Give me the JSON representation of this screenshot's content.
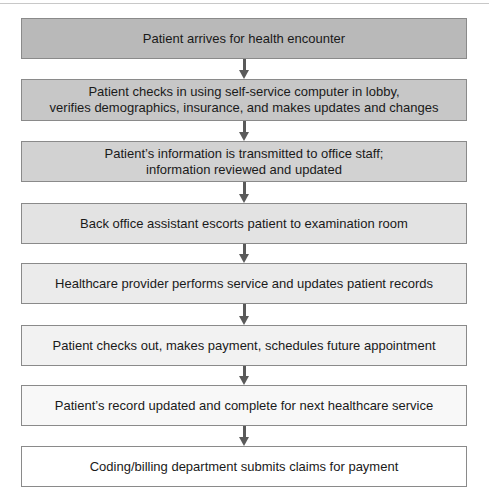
{
  "diagram": {
    "type": "flowchart",
    "direction": "top-to-bottom",
    "steps": [
      {
        "label": "Patient arrives for health encounter",
        "fill": "#b9b9b9"
      },
      {
        "label": "Patient checks in using self-service computer in lobby,\nverifies demographics, insurance, and makes updates and changes",
        "fill": "#c7c7c7"
      },
      {
        "label": "Patient’s information is transmitted to office staff;\ninformation reviewed and updated",
        "fill": "#d2d2d2"
      },
      {
        "label": "Back office assistant escorts patient to examination room",
        "fill": "#e3e3e3"
      },
      {
        "label": "Healthcare provider performs service and updates patient records",
        "fill": "#ebebeb"
      },
      {
        "label": "Patient checks out, makes payment, schedules future appointment",
        "fill": "#f2f2f2"
      },
      {
        "label": "Patient’s record updated and complete for next healthcare service",
        "fill": "#f8f8f8"
      },
      {
        "label": "Coding/billing department submits claims for payment",
        "fill": "#ffffff"
      }
    ],
    "connectors": [
      {
        "from": 0,
        "to": 1,
        "icon": "arrow-down-icon"
      },
      {
        "from": 1,
        "to": 2,
        "icon": "arrow-down-icon"
      },
      {
        "from": 2,
        "to": 3,
        "icon": "arrow-down-icon"
      },
      {
        "from": 3,
        "to": 4,
        "icon": "arrow-down-icon"
      },
      {
        "from": 4,
        "to": 5,
        "icon": "arrow-down-icon"
      },
      {
        "from": 5,
        "to": 6,
        "icon": "arrow-down-icon"
      },
      {
        "from": 6,
        "to": 7,
        "icon": "arrow-down-icon"
      }
    ],
    "colors": {
      "border": "#8a8a8a",
      "arrow": "#5a5a5a",
      "text": "#1a1a1a"
    }
  }
}
